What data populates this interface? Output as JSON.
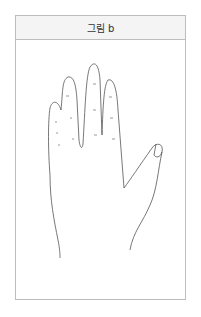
{
  "figure": {
    "title": "그림 b",
    "image_description": "Line drawing of the back of a left hand with fingers spread; small dash marks on the finger segments",
    "stroke_color": "#555555",
    "border_color": "#bdbdbd",
    "header_background": "#f4f4f4"
  }
}
